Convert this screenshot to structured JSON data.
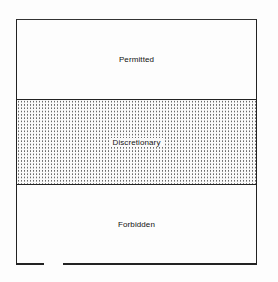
{
  "diagram": {
    "bands": [
      {
        "label": "Permitted",
        "fill": "none"
      },
      {
        "label": "Discretionary",
        "fill": "dotted"
      },
      {
        "label": "Forbidden",
        "fill": "none"
      }
    ],
    "colors": {
      "line": "#222222",
      "dots": "#6a6a6a",
      "background": "#fdfdfd"
    }
  }
}
